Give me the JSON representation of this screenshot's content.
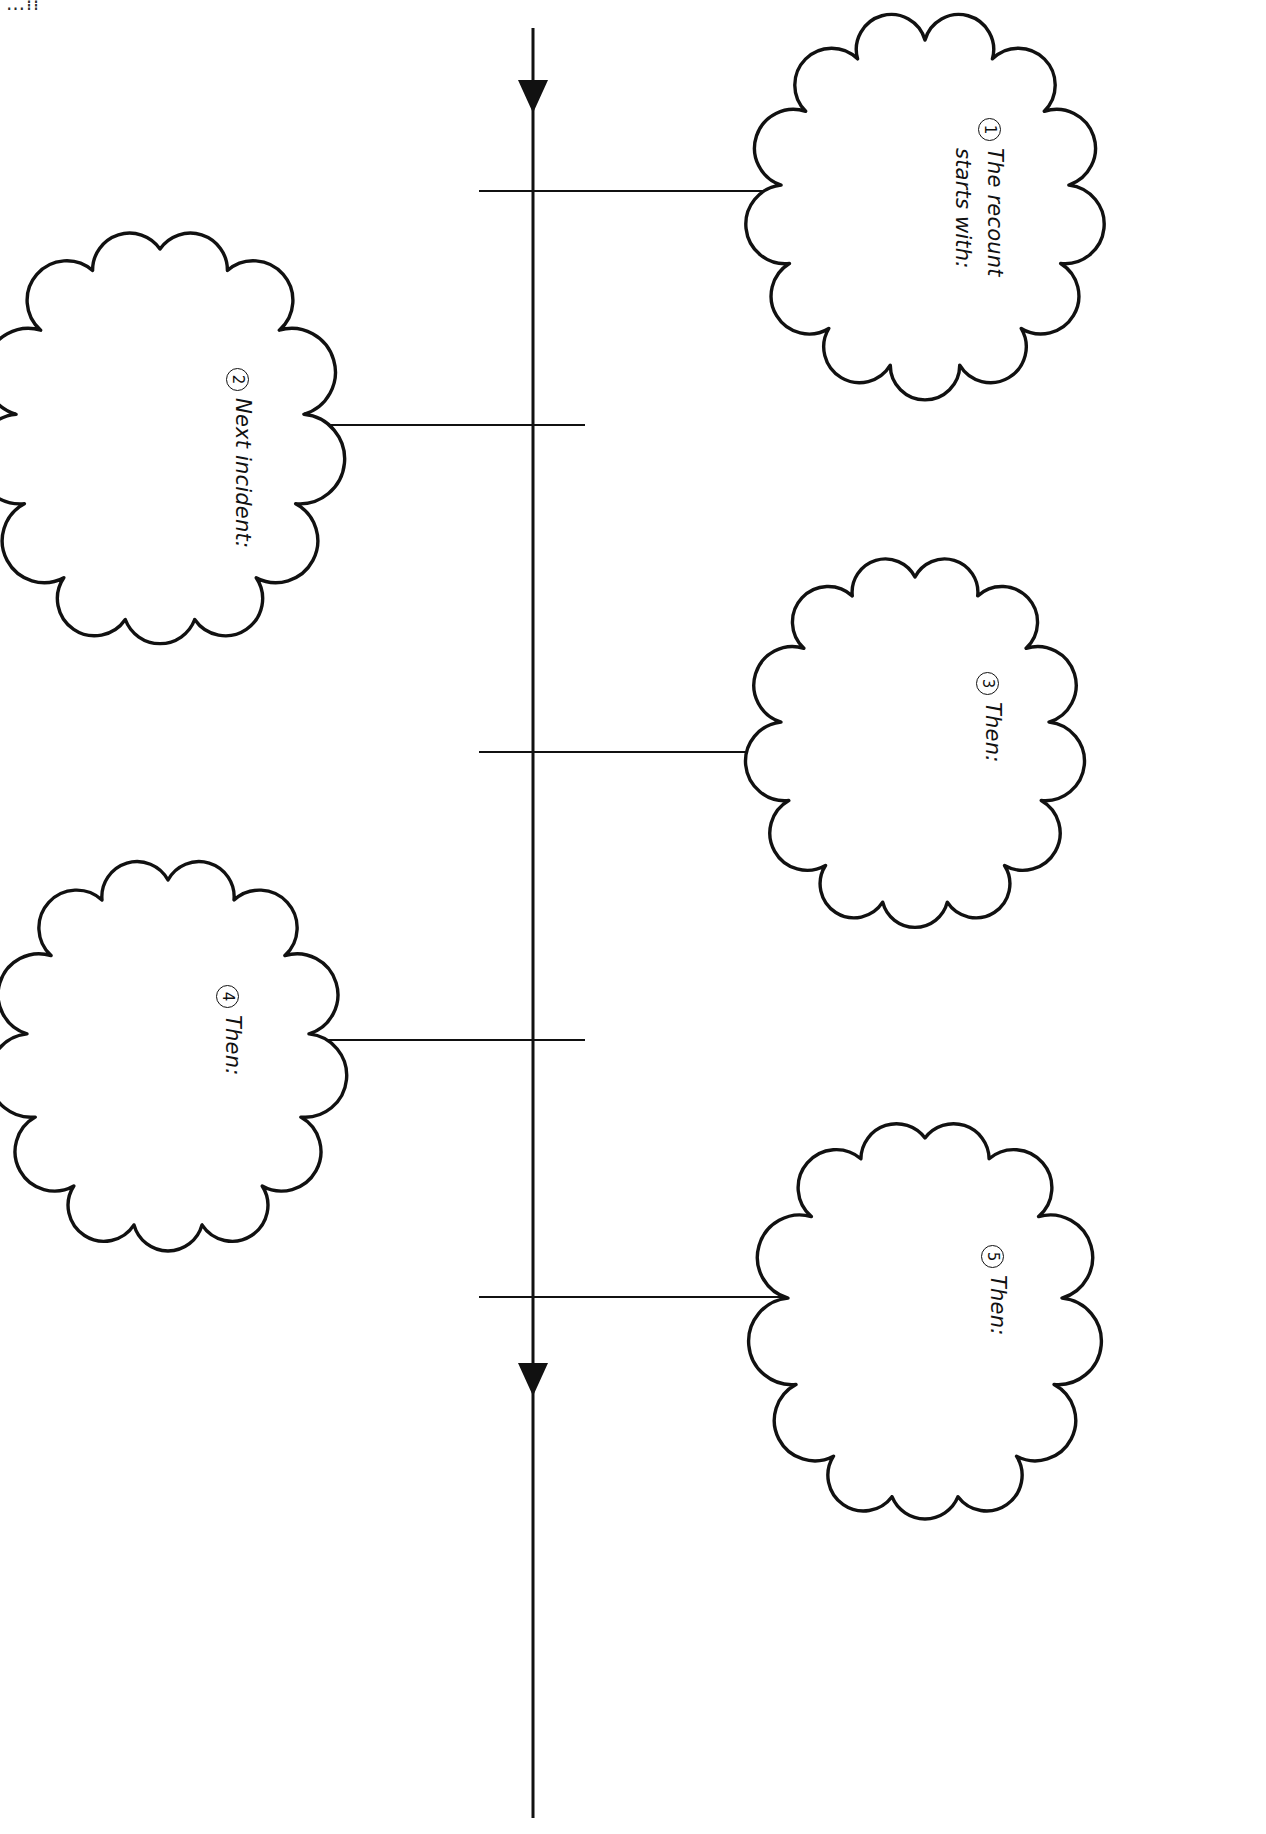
{
  "page": {
    "orientation": "landscape-rotated-90",
    "background_color": "#ffffff",
    "ink_color": "#111111",
    "width": 1266,
    "height": 1834,
    "corner_fragment": "…⁞⁞"
  },
  "timeline": {
    "name": "vertical-timeline-axis",
    "orientation": "vertical",
    "x": 533,
    "y_start": 28,
    "y_end": 1818,
    "arrow_top": true,
    "arrow_bottom": true,
    "stroke_width": 3,
    "ticks": [
      {
        "y": 191,
        "x_from": 479,
        "x_to": 533,
        "side": "left"
      },
      {
        "y": 425,
        "x_from": 533,
        "x_to": 585,
        "side": "right"
      },
      {
        "y": 752,
        "x_from": 479,
        "x_to": 533,
        "side": "left"
      },
      {
        "y": 1040,
        "x_from": 533,
        "x_to": 585,
        "side": "right"
      },
      {
        "y": 1297,
        "x_from": 479,
        "x_to": 533,
        "side": "left"
      }
    ]
  },
  "clouds": [
    {
      "id": "cloud-1",
      "number": "1",
      "label_line1": "The recount",
      "label_line2": "starts with:",
      "side": "right",
      "cx": 925,
      "cy": 205,
      "rx": 145,
      "ry": 165,
      "connector": {
        "x_from": 479,
        "y": 191,
        "x_to": 780
      },
      "text_x": 1010,
      "text_y": 118
    },
    {
      "id": "cloud-2",
      "number": "2",
      "label_line1": "Next incident:",
      "label_line2": "",
      "side": "left",
      "cx": 160,
      "cy": 437,
      "rx": 145,
      "ry": 188,
      "connector": {
        "x_from": 310,
        "y": 425,
        "x_to": 585
      },
      "text_x": 258,
      "text_y": 368
    },
    {
      "id": "cloud-3",
      "number": "3",
      "label_line1": "Then:",
      "label_line2": "",
      "side": "right",
      "cx": 915,
      "cy": 742,
      "rx": 135,
      "ry": 165,
      "connector": {
        "x_from": 479,
        "y": 752,
        "x_to": 786
      },
      "text_x": 1008,
      "text_y": 672
    },
    {
      "id": "cloud-4",
      "number": "4",
      "label_line1": "Then:",
      "label_line2": "",
      "side": "left",
      "cx": 168,
      "cy": 1055,
      "rx": 142,
      "ry": 175,
      "connector": {
        "x_from": 312,
        "y": 1040,
        "x_to": 585
      },
      "text_x": 248,
      "text_y": 985
    },
    {
      "id": "cloud-5",
      "number": "5",
      "label_line1": "Then:",
      "label_line2": "",
      "side": "right",
      "cx": 925,
      "cy": 1320,
      "rx": 138,
      "ry": 182,
      "connector": {
        "x_from": 479,
        "y": 1297,
        "x_to": 790
      },
      "text_x": 1013,
      "text_y": 1245
    }
  ]
}
